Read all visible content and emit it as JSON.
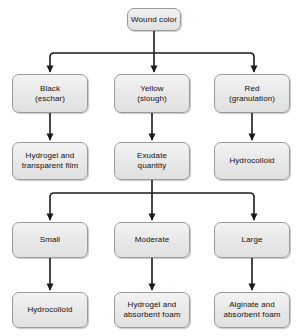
{
  "diagram": {
    "style": {
      "node_fill": "#e9e9e9",
      "node_border": "#9a9a9a",
      "edge_color": "#1a1a1a",
      "background": "#ffffff"
    },
    "nodes": [
      {
        "id": "wound-color",
        "label": "Wound color",
        "lines": [
          "Wound color"
        ],
        "x": 127,
        "y": 8,
        "w": 54,
        "h": 23
      },
      {
        "id": "black-eschar",
        "label": "Black (eschar)",
        "lines": [
          "Black",
          "(eschar)"
        ],
        "x": 12,
        "y": 74,
        "w": 76,
        "h": 39
      },
      {
        "id": "yellow-slough",
        "label": "Yellow (slough)",
        "lines": [
          "Yellow",
          "(slough)"
        ],
        "x": 114,
        "y": 74,
        "w": 76,
        "h": 39
      },
      {
        "id": "red-granulation",
        "label": "Red (granulation)",
        "lines": [
          "Red",
          "(granulation)"
        ],
        "x": 214,
        "y": 74,
        "w": 76,
        "h": 39
      },
      {
        "id": "hydrogel-film",
        "label": "Hydrogel and transparent film",
        "lines": [
          "Hydrogel and",
          "transparent film"
        ],
        "x": 12,
        "y": 142,
        "w": 76,
        "h": 38
      },
      {
        "id": "exudate-quantity",
        "label": "Exudate quantity",
        "lines": [
          "Exudate",
          "quantity"
        ],
        "x": 114,
        "y": 142,
        "w": 76,
        "h": 38
      },
      {
        "id": "hydrocolloid-red",
        "label": "Hydrocolloid",
        "lines": [
          "Hydrocolloid"
        ],
        "x": 214,
        "y": 142,
        "w": 76,
        "h": 38
      },
      {
        "id": "small",
        "label": "Small",
        "lines": [
          "Small"
        ],
        "x": 12,
        "y": 222,
        "w": 76,
        "h": 36
      },
      {
        "id": "moderate",
        "label": "Moderate",
        "lines": [
          "Moderate"
        ],
        "x": 114,
        "y": 222,
        "w": 76,
        "h": 36
      },
      {
        "id": "large",
        "label": "Large",
        "lines": [
          "Large"
        ],
        "x": 214,
        "y": 222,
        "w": 76,
        "h": 36
      },
      {
        "id": "hydrocolloid-small",
        "label": "Hydrocolloid",
        "lines": [
          "Hydrocolloid"
        ],
        "x": 12,
        "y": 292,
        "w": 76,
        "h": 36
      },
      {
        "id": "hydrogel-foam",
        "label": "Hydrogel and absorbent foam",
        "lines": [
          "Hydrogel and",
          "absorbent foam"
        ],
        "x": 114,
        "y": 292,
        "w": 76,
        "h": 36
      },
      {
        "id": "alginate-foam",
        "label": "Alginate and absorbent foam",
        "lines": [
          "Alginate and",
          "absorbent foam"
        ],
        "x": 214,
        "y": 292,
        "w": 76,
        "h": 36
      }
    ],
    "edges": [
      {
        "from": "wound-color",
        "to": "black-eschar",
        "type": "branch"
      },
      {
        "from": "wound-color",
        "to": "yellow-slough",
        "type": "straight"
      },
      {
        "from": "wound-color",
        "to": "red-granulation",
        "type": "branch"
      },
      {
        "from": "black-eschar",
        "to": "hydrogel-film",
        "type": "straight"
      },
      {
        "from": "yellow-slough",
        "to": "exudate-quantity",
        "type": "straight"
      },
      {
        "from": "red-granulation",
        "to": "hydrocolloid-red",
        "type": "straight"
      },
      {
        "from": "exudate-quantity",
        "to": "small",
        "type": "branch"
      },
      {
        "from": "exudate-quantity",
        "to": "moderate",
        "type": "straight"
      },
      {
        "from": "exudate-quantity",
        "to": "large",
        "type": "branch"
      },
      {
        "from": "small",
        "to": "hydrocolloid-small",
        "type": "straight"
      },
      {
        "from": "moderate",
        "to": "hydrogel-foam",
        "type": "straight"
      },
      {
        "from": "large",
        "to": "alginate-foam",
        "type": "straight"
      }
    ]
  }
}
